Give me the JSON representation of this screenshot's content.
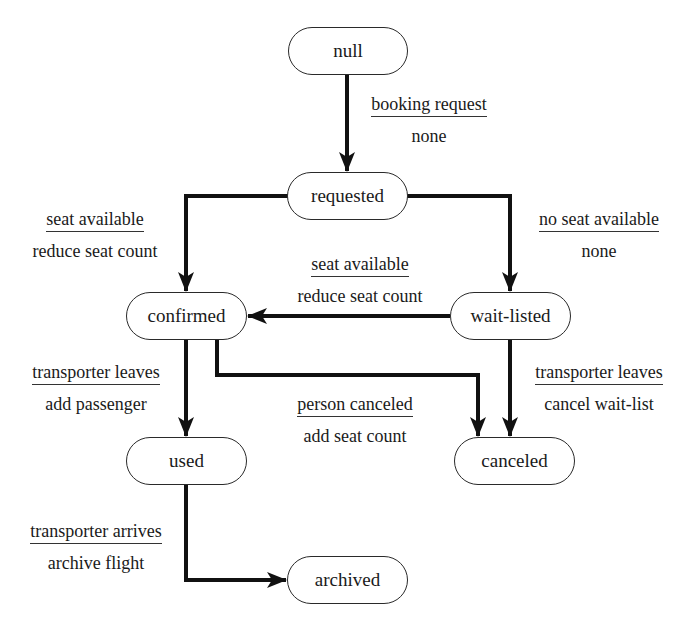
{
  "diagram": {
    "type": "state-machine",
    "states": {
      "null": "null",
      "requested": "requested",
      "confirmed": "confirmed",
      "wait_listed": "wait-listed",
      "used": "used",
      "canceled": "canceled",
      "archived": "archived"
    },
    "transitions": [
      {
        "from": "null",
        "to": "requested",
        "event": "booking request",
        "action": "none"
      },
      {
        "from": "requested",
        "to": "confirmed",
        "event": "seat available",
        "action": "reduce seat count"
      },
      {
        "from": "requested",
        "to": "wait-listed",
        "event": "no seat available",
        "action": "none"
      },
      {
        "from": "wait-listed",
        "to": "confirmed",
        "event": "seat available",
        "action": "reduce seat count"
      },
      {
        "from": "confirmed",
        "to": "used",
        "event": "transporter leaves",
        "action": "add passenger"
      },
      {
        "from": "confirmed",
        "to": "canceled",
        "event": "person canceled",
        "action": "add seat count"
      },
      {
        "from": "wait-listed",
        "to": "canceled",
        "event": "transporter leaves",
        "action": "cancel wait-list"
      },
      {
        "from": "used",
        "to": "archived",
        "event": "transporter arrives",
        "action": "archive flight"
      }
    ]
  }
}
